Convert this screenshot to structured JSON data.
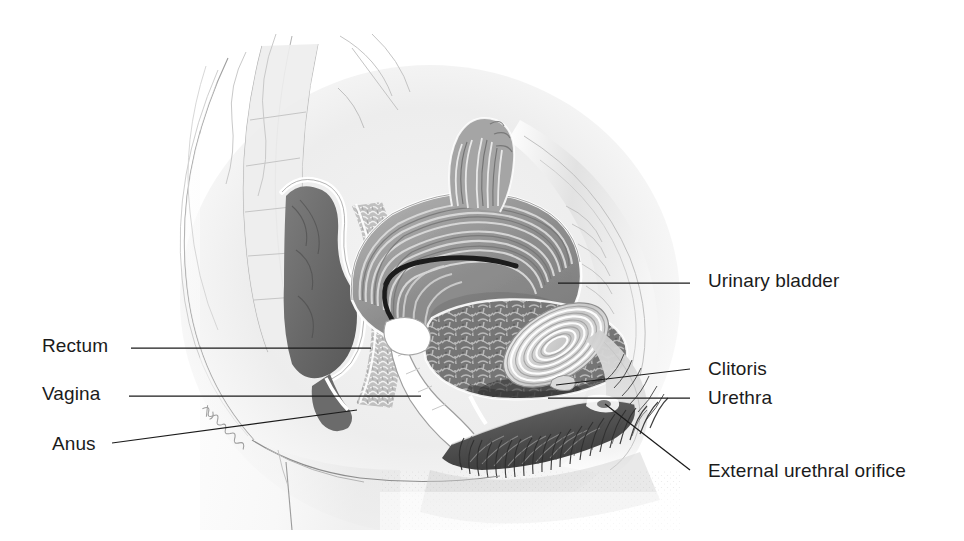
{
  "figure": {
    "type": "anatomical-illustration",
    "style": "grayscale pencil / airbrush medical illustration",
    "background_color": "#ffffff",
    "line_color": "#1b1b1b",
    "text_color": "#1b1b1b",
    "artist_signature": "illegible cursive signature along buttock contour"
  },
  "labels": {
    "left": [
      {
        "id": "rectum",
        "text": "Rectum",
        "x": 42,
        "y": 348,
        "leader": {
          "x1": 131,
          "y1": 348,
          "x2": 371,
          "y2": 348
        }
      },
      {
        "id": "vagina",
        "text": "Vagina",
        "x": 42,
        "y": 396,
        "leader": {
          "x1": 129,
          "y1": 396,
          "x2": 421,
          "y2": 396
        }
      },
      {
        "id": "anus",
        "text": "Anus",
        "x": 52,
        "y": 446,
        "leader": {
          "x1": 112,
          "y1": 443,
          "x2": 357,
          "y2": 410
        }
      }
    ],
    "right": [
      {
        "id": "urinary-bladder",
        "text": "Urinary bladder",
        "x": 708,
        "y": 283,
        "leader": {
          "x1": 690,
          "y1": 283,
          "x2": 558,
          "y2": 283
        }
      },
      {
        "id": "clitoris",
        "text": "Clitoris",
        "x": 708,
        "y": 371,
        "leader": {
          "x1": 690,
          "y1": 369,
          "x2": 556,
          "y2": 385
        }
      },
      {
        "id": "urethra",
        "text": "Urethra",
        "x": 708,
        "y": 400,
        "leader": {
          "x1": 690,
          "y1": 398,
          "x2": 548,
          "y2": 398
        }
      },
      {
        "id": "external-urethral-orifice",
        "text": "External urethral orifice",
        "x": 708,
        "y": 473,
        "leader": {
          "x1": 690,
          "y1": 470,
          "x2": 605,
          "y2": 404
        }
      }
    ]
  },
  "structures": [
    {
      "name": "sacrum-and-vertebrae",
      "tone": "#e8e8e8"
    },
    {
      "name": "rectum",
      "tone": "#6e6e6e"
    },
    {
      "name": "uterus",
      "tone": "#9a9a9a"
    },
    {
      "name": "uterine-cavity",
      "tone": "#232323"
    },
    {
      "name": "urinary-bladder",
      "tone": "#7c7c7c"
    },
    {
      "name": "pubic-symphysis",
      "tone": "#cfcfcf"
    },
    {
      "name": "vagina",
      "tone": "#ffffff"
    },
    {
      "name": "labia-and-perineum",
      "tone": "#5a5a5a"
    },
    {
      "name": "pubic-hair",
      "tone": "#2e2e2e"
    },
    {
      "name": "abdominal-wall",
      "tone": "#d8d8d8"
    },
    {
      "name": "thigh-contour",
      "tone": "#8f8f8f"
    }
  ]
}
